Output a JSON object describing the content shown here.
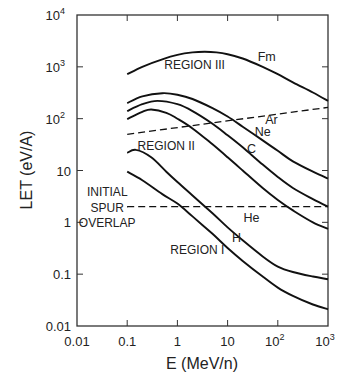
{
  "chart_data": {
    "type": "line",
    "title": "",
    "xlabel": "E (MeV/n)",
    "ylabel": "LET (eV/A)",
    "xscale": "log",
    "yscale": "log",
    "xlim": [
      0.01,
      1000
    ],
    "ylim": [
      0.01,
      10000
    ],
    "grid": false,
    "legend": "none (curves labeled inline)",
    "x_ticks": [
      {
        "value": 0.01,
        "label": "0.01"
      },
      {
        "value": 0.1,
        "label": "0.1"
      },
      {
        "value": 1,
        "label": "1"
      },
      {
        "value": 10,
        "label": "10"
      },
      {
        "value": 100,
        "label": "10",
        "sup": "2"
      },
      {
        "value": 1000,
        "label": "10",
        "sup": "3"
      }
    ],
    "y_ticks": [
      {
        "value": 0.01,
        "label": "0.01"
      },
      {
        "value": 0.1,
        "label": "0.1"
      },
      {
        "value": 1,
        "label": "1"
      },
      {
        "value": 10,
        "label": "10"
      },
      {
        "value": 100,
        "label": "10",
        "sup": "2"
      },
      {
        "value": 1000,
        "label": "10",
        "sup": "3"
      },
      {
        "value": 10000,
        "label": "10",
        "sup": "4"
      }
    ],
    "series": [
      {
        "name": "Fm",
        "style": "solid",
        "x": [
          0.1,
          0.2,
          0.5,
          1,
          2,
          3.5,
          6,
          10,
          20,
          50,
          100,
          200,
          500,
          1000
        ],
        "y": [
          720,
          1000,
          1400,
          1700,
          1900,
          1950,
          1900,
          1750,
          1450,
          1000,
          720,
          500,
          320,
          220
        ]
      },
      {
        "name": "Ar",
        "style": "solid",
        "x": [
          0.1,
          0.2,
          0.5,
          1,
          2,
          5,
          10,
          20,
          50,
          100,
          200,
          500,
          1000
        ],
        "y": [
          200,
          270,
          310,
          290,
          240,
          160,
          110,
          70,
          38,
          24,
          15,
          9.5,
          7
        ]
      },
      {
        "name": "Ne",
        "style": "solid",
        "x": [
          0.1,
          0.2,
          0.4,
          1,
          2,
          5,
          10,
          20,
          50,
          100,
          200,
          500,
          1000
        ],
        "y": [
          140,
          190,
          220,
          190,
          140,
          80,
          48,
          28,
          13,
          7.5,
          4.6,
          2.8,
          2.0
        ]
      },
      {
        "name": "C",
        "style": "solid",
        "x": [
          0.1,
          0.2,
          0.3,
          0.6,
          1,
          2,
          5,
          10,
          20,
          50,
          100,
          200,
          500,
          1000
        ],
        "y": [
          98,
          135,
          150,
          130,
          100,
          65,
          32,
          18,
          10,
          4.6,
          2.7,
          1.7,
          1.0,
          0.75
        ]
      },
      {
        "name": "He",
        "style": "solid",
        "x": [
          0.1,
          0.15,
          0.3,
          0.6,
          1,
          2,
          5,
          10,
          20,
          50,
          100,
          200,
          500,
          1000
        ],
        "y": [
          22,
          25,
          18,
          9.5,
          6,
          3.3,
          1.5,
          0.8,
          0.45,
          0.22,
          0.14,
          0.11,
          0.09,
          0.08
        ]
      },
      {
        "name": "H",
        "style": "solid",
        "x": [
          0.1,
          0.2,
          0.5,
          1,
          2,
          5,
          10,
          20,
          50,
          100,
          200,
          500,
          1000
        ],
        "y": [
          9.5,
          6.5,
          3.5,
          2.3,
          1.3,
          0.6,
          0.32,
          0.18,
          0.09,
          0.055,
          0.038,
          0.026,
          0.021
        ]
      },
      {
        "name": "Region II/III boundary",
        "style": "dashed",
        "x": [
          0.1,
          1000
        ],
        "y": [
          50,
          165
        ]
      },
      {
        "name": "Initial spur overlap",
        "style": "dashed",
        "x": [
          0.1,
          1000
        ],
        "y": [
          2.0,
          2.0
        ]
      }
    ],
    "annotations": [
      {
        "text": "REGION III",
        "x": 2.2,
        "y": 900
      },
      {
        "text": "REGION II",
        "x": 0.6,
        "y": 25
      },
      {
        "text": "REGION I",
        "x": 2.5,
        "y": 0.25
      },
      {
        "text": "INITIAL",
        "x": 0.04,
        "y": 3.2
      },
      {
        "text": "SPUR",
        "x": 0.04,
        "y": 1.6
      },
      {
        "text": "OVERLAP",
        "x": 0.04,
        "y": 0.8
      },
      {
        "text": "Fm",
        "x": 60,
        "y": 1300
      },
      {
        "text": "Ar",
        "x": 75,
        "y": 78
      },
      {
        "text": "Ne",
        "x": 50,
        "y": 46
      },
      {
        "text": "C",
        "x": 30,
        "y": 22
      },
      {
        "text": "He",
        "x": 30,
        "y": 1.0
      },
      {
        "text": "H",
        "x": 15,
        "y": 0.42
      }
    ]
  }
}
